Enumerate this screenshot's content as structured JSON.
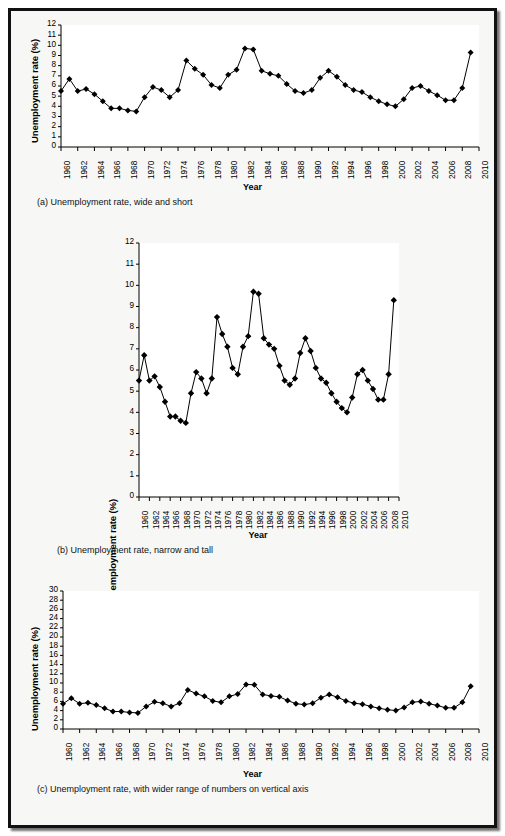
{
  "figure": {
    "background_color": "#f7f7f5",
    "border_color": "#111111",
    "series_color": "#000000",
    "marker": "diamond"
  },
  "shared": {
    "ylabel": "Unemployment rate (%)",
    "xlabel": "Year",
    "xtick_labels": [
      "1960",
      "1962",
      "1964",
      "1966",
      "1968",
      "1970",
      "1972",
      "1974",
      "1976",
      "1978",
      "1980",
      "1982",
      "1984",
      "1986",
      "1988",
      "1990",
      "1992",
      "1994",
      "1996",
      "1998",
      "2000",
      "2002",
      "2004",
      "2006",
      "2008",
      "2010"
    ]
  },
  "panels": [
    {
      "id": "a",
      "caption": "(a) Unemployment rate, wide and short",
      "ytick_labels": [
        "12",
        "11",
        "10",
        "9",
        "8",
        "7",
        "6",
        "5",
        "4",
        "3",
        "2",
        "1",
        "0"
      ]
    },
    {
      "id": "b",
      "caption": "(b) Unemployment rate, narrow and tall",
      "ytick_labels": [
        "12",
        "11",
        "10",
        "9",
        "8",
        "7",
        "6",
        "5",
        "4",
        "3",
        "2",
        "1",
        "0"
      ]
    },
    {
      "id": "c",
      "caption": "(c) Unemployment rate, with wider range of numbers on vertical axis",
      "ytick_labels": [
        "30",
        "28",
        "26",
        "24",
        "22",
        "20",
        "18",
        "16",
        "14",
        "12",
        "10",
        "8",
        "6",
        "4",
        "2",
        "0"
      ]
    }
  ],
  "chart_data": [
    {
      "type": "line",
      "id": "a",
      "title": "(a) Unemployment rate, wide and short",
      "xlabel": "Year",
      "ylabel": "Unemployment rate (%)",
      "xlim": [
        1960,
        2010
      ],
      "ylim": [
        0,
        12
      ],
      "ytick_step": 1,
      "xtick_step": 2,
      "grid": false,
      "legend": false,
      "marker": "diamond",
      "x": [
        1960,
        1961,
        1962,
        1963,
        1964,
        1965,
        1966,
        1967,
        1968,
        1969,
        1970,
        1971,
        1972,
        1973,
        1974,
        1975,
        1976,
        1977,
        1978,
        1979,
        1980,
        1981,
        1982,
        1983,
        1984,
        1985,
        1986,
        1987,
        1988,
        1989,
        1990,
        1991,
        1992,
        1993,
        1994,
        1995,
        1996,
        1997,
        1998,
        1999,
        2000,
        2001,
        2002,
        2003,
        2004,
        2005,
        2006,
        2007,
        2008,
        2009
      ],
      "values": [
        5.5,
        6.7,
        5.5,
        5.7,
        5.2,
        4.5,
        3.8,
        3.8,
        3.6,
        3.5,
        4.9,
        5.9,
        5.6,
        4.9,
        5.6,
        8.5,
        7.7,
        7.1,
        6.1,
        5.8,
        7.1,
        7.6,
        9.7,
        9.6,
        7.5,
        7.2,
        7.0,
        6.2,
        5.5,
        5.3,
        5.6,
        6.8,
        7.5,
        6.9,
        6.1,
        5.6,
        5.4,
        4.9,
        4.5,
        4.2,
        4.0,
        4.7,
        5.8,
        6.0,
        5.5,
        5.1,
        4.6,
        4.6,
        5.8,
        9.3
      ]
    },
    {
      "type": "line",
      "id": "b",
      "title": "(b) Unemployment rate, narrow and tall",
      "xlabel": "Year",
      "ylabel": "Unemployment rate (%)",
      "xlim": [
        1960,
        2010
      ],
      "ylim": [
        0,
        12
      ],
      "ytick_step": 1,
      "xtick_step": 2,
      "grid": false,
      "legend": false,
      "marker": "diamond",
      "x": [
        1960,
        1961,
        1962,
        1963,
        1964,
        1965,
        1966,
        1967,
        1968,
        1969,
        1970,
        1971,
        1972,
        1973,
        1974,
        1975,
        1976,
        1977,
        1978,
        1979,
        1980,
        1981,
        1982,
        1983,
        1984,
        1985,
        1986,
        1987,
        1988,
        1989,
        1990,
        1991,
        1992,
        1993,
        1994,
        1995,
        1996,
        1997,
        1998,
        1999,
        2000,
        2001,
        2002,
        2003,
        2004,
        2005,
        2006,
        2007,
        2008,
        2009
      ],
      "values": [
        5.5,
        6.7,
        5.5,
        5.7,
        5.2,
        4.5,
        3.8,
        3.8,
        3.6,
        3.5,
        4.9,
        5.9,
        5.6,
        4.9,
        5.6,
        8.5,
        7.7,
        7.1,
        6.1,
        5.8,
        7.1,
        7.6,
        9.7,
        9.6,
        7.5,
        7.2,
        7.0,
        6.2,
        5.5,
        5.3,
        5.6,
        6.8,
        7.5,
        6.9,
        6.1,
        5.6,
        5.4,
        4.9,
        4.5,
        4.2,
        4.0,
        4.7,
        5.8,
        6.0,
        5.5,
        5.1,
        4.6,
        4.6,
        5.8,
        9.3
      ]
    },
    {
      "type": "line",
      "id": "c",
      "title": "(c) Unemployment rate, with wider range of numbers on vertical axis",
      "xlabel": "Year",
      "ylabel": "Unemployment rate (%)",
      "xlim": [
        1960,
        2010
      ],
      "ylim": [
        0,
        30
      ],
      "ytick_step": 2,
      "xtick_step": 2,
      "grid": false,
      "legend": false,
      "marker": "diamond",
      "x": [
        1960,
        1961,
        1962,
        1963,
        1964,
        1965,
        1966,
        1967,
        1968,
        1969,
        1970,
        1971,
        1972,
        1973,
        1974,
        1975,
        1976,
        1977,
        1978,
        1979,
        1980,
        1981,
        1982,
        1983,
        1984,
        1985,
        1986,
        1987,
        1988,
        1989,
        1990,
        1991,
        1992,
        1993,
        1994,
        1995,
        1996,
        1997,
        1998,
        1999,
        2000,
        2001,
        2002,
        2003,
        2004,
        2005,
        2006,
        2007,
        2008,
        2009
      ],
      "values": [
        5.5,
        6.7,
        5.5,
        5.7,
        5.2,
        4.5,
        3.8,
        3.8,
        3.6,
        3.5,
        4.9,
        5.9,
        5.6,
        4.9,
        5.6,
        8.5,
        7.7,
        7.1,
        6.1,
        5.8,
        7.1,
        7.6,
        9.7,
        9.6,
        7.5,
        7.2,
        7.0,
        6.2,
        5.5,
        5.3,
        5.6,
        6.8,
        7.5,
        6.9,
        6.1,
        5.6,
        5.4,
        4.9,
        4.5,
        4.2,
        4.0,
        4.7,
        5.8,
        6.0,
        5.5,
        5.1,
        4.6,
        4.6,
        5.8,
        9.3
      ]
    }
  ]
}
